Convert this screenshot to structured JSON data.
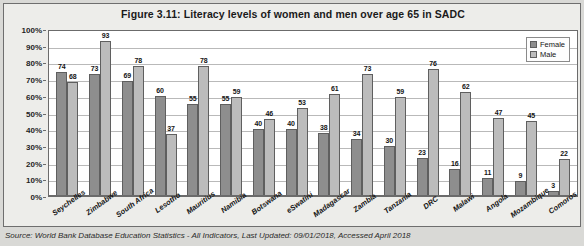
{
  "figure": {
    "title": "Figure 3.11: Literacy levels of women and men over age 65 in SADC",
    "source": "Source: World Bank Database Education Statistics - All Indicators, Last Updated: 09/01/2018, Accessed April 2018"
  },
  "legend": {
    "female_label": "Female",
    "male_label": "Male",
    "female_color": "#8e8e8e",
    "male_color": "#bcbcbc"
  },
  "axis": {
    "y_ticks": [
      "100%",
      "90%",
      "80%",
      "70%",
      "60%",
      "50%",
      "40%",
      "30%",
      "20%",
      "10%",
      "0%"
    ]
  },
  "chart_data": {
    "type": "bar",
    "title": "Figure 3.11: Literacy levels of women and men over age 65 in SADC",
    "xlabel": "",
    "ylabel": "",
    "ylim": [
      0,
      100
    ],
    "ytick_labels": [
      "0%",
      "10%",
      "20%",
      "30%",
      "40%",
      "50%",
      "60%",
      "70%",
      "80%",
      "90%",
      "100%"
    ],
    "grid": true,
    "legend_position": "top-right",
    "categories": [
      "Seychelles",
      "Zimbabwe",
      "South Africa",
      "Lesotho",
      "Mauritius",
      "Namibia",
      "Botswana",
      "eSwatini",
      "Madagascar",
      "Zambia",
      "Tanzania",
      "DRC",
      "Malawi",
      "Angola",
      "Mozambique",
      "Comoros"
    ],
    "series": [
      {
        "name": "Female",
        "color": "#8e8e8e",
        "values": [
          74,
          73,
          69,
          60,
          55,
          55,
          40,
          40,
          38,
          34,
          30,
          23,
          16,
          11,
          9,
          3
        ]
      },
      {
        "name": "Male",
        "color": "#bcbcbc",
        "values": [
          68,
          93,
          78,
          37,
          78,
          59,
          46,
          53,
          61,
          73,
          59,
          76,
          62,
          47,
          45,
          22
        ]
      }
    ]
  }
}
